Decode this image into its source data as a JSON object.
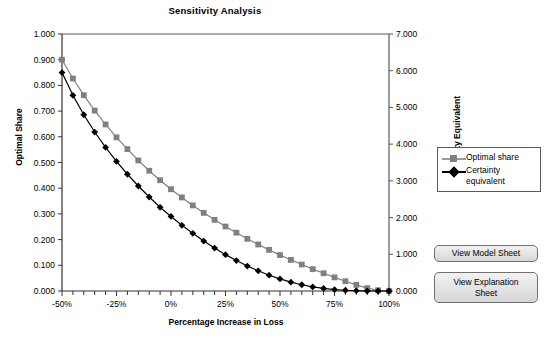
{
  "chart_data": {
    "type": "line",
    "title": "Sensitivity Analysis",
    "xlabel": "Percentage Increase in Loss",
    "ylabel": "Optimal Share",
    "y2label": "Certainty Equivalent",
    "xlim": [
      -50,
      100
    ],
    "ylim": [
      0.0,
      1.0
    ],
    "y2lim": [
      0.0,
      7.0
    ],
    "grid": false,
    "legend_position": "right",
    "xticks": [
      "-50%",
      "-25%",
      "0%",
      "25%",
      "50%",
      "75%",
      "100%"
    ],
    "xtick_values": [
      -50,
      -25,
      0,
      25,
      50,
      75,
      100
    ],
    "xtick_minor_step": 5,
    "yticks_left": [
      "0.000",
      "0.100",
      "0.200",
      "0.300",
      "0.400",
      "0.500",
      "0.600",
      "0.700",
      "0.800",
      "0.900",
      "1.000"
    ],
    "ytick_left_values": [
      0.0,
      0.1,
      0.2,
      0.3,
      0.4,
      0.5,
      0.6,
      0.7,
      0.8,
      0.9,
      1.0
    ],
    "yticks_right": [
      "0.000",
      "1.000",
      "2.000",
      "3.000",
      "4.000",
      "5.000",
      "6.000",
      "7.000"
    ],
    "ytick_right_values": [
      0,
      1,
      2,
      3,
      4,
      5,
      6,
      7
    ],
    "x": [
      -50,
      -45,
      -40,
      -35,
      -30,
      -25,
      -20,
      -15,
      -10,
      -5,
      0,
      5,
      10,
      15,
      20,
      25,
      30,
      35,
      40,
      45,
      50,
      55,
      60,
      65,
      70,
      75,
      80,
      85,
      90,
      95,
      100
    ],
    "series": [
      {
        "name": "Optimal share",
        "axis": "left",
        "color": "#808080",
        "marker": "square",
        "values": [
          0.9,
          0.827,
          0.762,
          0.702,
          0.648,
          0.598,
          0.552,
          0.508,
          0.468,
          0.431,
          0.396,
          0.364,
          0.333,
          0.304,
          0.277,
          0.251,
          0.227,
          0.203,
          0.181,
          0.16,
          0.14,
          0.121,
          0.103,
          0.085,
          0.069,
          0.053,
          0.038,
          0.024,
          0.011,
          0.003,
          0.0
        ]
      },
      {
        "name": "Certainty equivalent",
        "axis": "right",
        "color": "#000000",
        "marker": "diamond",
        "values": [
          5.95,
          5.33,
          4.8,
          4.33,
          3.91,
          3.53,
          3.18,
          2.86,
          2.56,
          2.28,
          2.03,
          1.79,
          1.57,
          1.36,
          1.17,
          0.99,
          0.83,
          0.68,
          0.55,
          0.43,
          0.33,
          0.24,
          0.17,
          0.11,
          0.07,
          0.04,
          0.02,
          0.01,
          0.0,
          0.0,
          0.0
        ]
      }
    ]
  },
  "legend": {
    "items": [
      {
        "label": "Optimal share"
      },
      {
        "label_line1": "Certainty",
        "label_line2": "equivalent"
      }
    ]
  },
  "buttons": {
    "model_sheet": "View Model Sheet",
    "explanation_sheet_line1": "View Explanation",
    "explanation_sheet_line2": "Sheet"
  },
  "colors": {
    "optimal_share": "#808080",
    "certainty_equivalent": "#000000",
    "axis": "#595959",
    "button_border": "#707070"
  }
}
